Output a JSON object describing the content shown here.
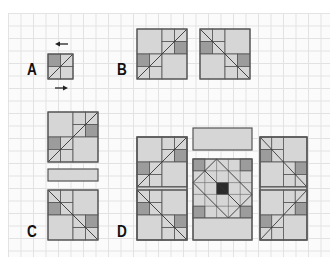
{
  "figure": {
    "labels": {
      "a": "A",
      "b": "B",
      "c": "C",
      "d": "D"
    },
    "colors": {
      "light": "#d6d6d6",
      "medium": "#9c9c9c",
      "dark": "#2b2b2b",
      "stroke": "#555555",
      "grid": "#e2e2e2"
    },
    "panels": [
      {
        "id": "A",
        "description": "2x2 unit block with diagonal, arrows left (top) and right (bottom)"
      },
      {
        "id": "B",
        "description": "two 4x4 blocks, mirrored diagonals"
      },
      {
        "id": "C",
        "description": "two blocks stacked with a horizontal bar between them"
      },
      {
        "id": "D",
        "description": "three columns assembled: left/right block pairs with sashing, center block with dark center square and top bar"
      }
    ]
  }
}
